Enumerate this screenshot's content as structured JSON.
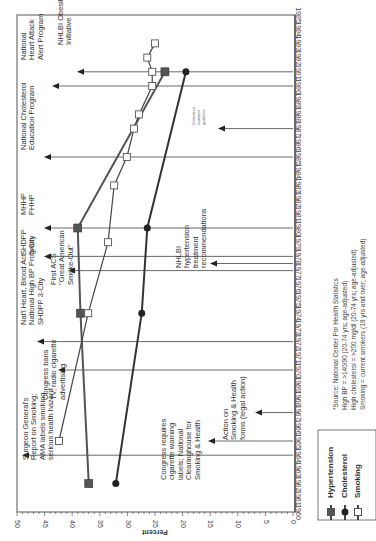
{
  "chart_data": {
    "type": "line",
    "orientation": "rotated-90-clockwise",
    "title": "",
    "xlabel": "",
    "ylabel": "Percent",
    "ylim": [
      0,
      50
    ],
    "xlim": [
      1960,
      1995
    ],
    "y_ticks": [
      0,
      5,
      10,
      15,
      20,
      25,
      30,
      35,
      40,
      45,
      50
    ],
    "x_ticks": [
      1960,
      1961,
      1962,
      1963,
      1964,
      1965,
      1966,
      1967,
      1968,
      1969,
      1970,
      1971,
      1972,
      1973,
      1974,
      1975,
      1976,
      1977,
      1978,
      1979,
      1980,
      1981,
      1982,
      1983,
      1984,
      1985,
      1986,
      1987,
      1988,
      1989,
      1990,
      1991,
      1992,
      1993,
      1994,
      1995
    ],
    "grid": false,
    "legend_position": "lower-right (rotated)",
    "series": [
      {
        "name": "Hypertension",
        "marker": "filled-square",
        "color": "#555555",
        "points": [
          [
            1962,
            37.0
          ],
          [
            1974,
            38.5
          ],
          [
            1980,
            39.0
          ],
          [
            1991,
            23.2
          ]
        ]
      },
      {
        "name": "Cholesterol",
        "marker": "filled-circle",
        "color": "#333333",
        "points": [
          [
            1962,
            32.1
          ],
          [
            1974,
            27.4
          ],
          [
            1980,
            26.4
          ],
          [
            1991,
            19.4
          ]
        ]
      },
      {
        "name": "Smoking",
        "marker": "open-square",
        "color": "#444444",
        "points": [
          [
            1965,
            42.4
          ],
          [
            1974,
            37.1
          ],
          [
            1979,
            33.5
          ],
          [
            1983,
            32.4
          ],
          [
            1985,
            30.1
          ],
          [
            1987,
            28.8
          ],
          [
            1988,
            27.9
          ],
          [
            1990,
            25.5
          ],
          [
            1991,
            25.5
          ],
          [
            1992,
            26.4
          ],
          [
            1993,
            25.0
          ]
        ]
      }
    ],
    "annotations": [
      {
        "year": 1964,
        "text": [
          "Surgeon General's",
          "Report on Smoking;",
          "AMA labels smoking",
          "serious health hazard"
        ]
      },
      {
        "year": 1965,
        "text": [
          "Congress requires",
          "cigarette warning",
          "labels; National",
          "Clearinghouse for",
          "Smoking & Health"
        ]
      },
      {
        "year": 1967,
        "text": [
          "Action on",
          "Smoking & Health",
          "forms (legal action)"
        ]
      },
      {
        "year": 1970,
        "text": [
          "Congress bans",
          "TV, radio cigarette",
          "advertising"
        ]
      },
      {
        "year": 1972,
        "text": [
          "Nat'l Heart, Blood Act",
          "National High BP Program",
          "SHDPP 3-City"
        ]
      },
      {
        "year": 1977,
        "text": [
          "First ACS",
          "\"Great American",
          "Smoke-Out\""
        ]
      },
      {
        "year": 1977.5,
        "text": [
          "NHLBI",
          "hypertension",
          "treatment",
          "recommendations"
        ]
      },
      {
        "year": 1978,
        "text": [
          "SHDPP",
          "5-City"
        ]
      },
      {
        "year": 1980,
        "text": [
          "MHHP",
          "PHHP"
        ]
      },
      {
        "year": 1985,
        "text": [
          "National Cholesterol",
          "Education Program"
        ]
      },
      {
        "year": 1987,
        "text": [
          "Cholesterol",
          "treatment",
          "guidelines"
        ]
      },
      {
        "year": 1990,
        "text": [
          "National",
          "Heart Attack",
          "Alert Program"
        ]
      },
      {
        "year": 1991,
        "text": [
          "NHLBI Obesity",
          "Initiative"
        ]
      }
    ],
    "source_note": [
      "*Source: National Center For Health Statistics",
      "High BP = >140/90 (20-74 yrs; age-adjusted)",
      "High cholesterol = >200 mg/dl (20-74 yrs; age-adjusted)",
      "Smoking = current smokers (18 yrs and over; age-adjusted)"
    ]
  },
  "labels": {
    "axis_percent": "Percent",
    "legend": [
      "Hypertension",
      "Cholesterol",
      "Smoking"
    ]
  }
}
